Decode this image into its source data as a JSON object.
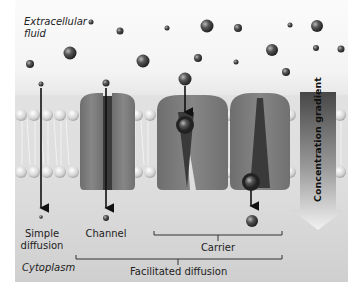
{
  "diagram": {
    "regions": {
      "outside": "Extracellular fluid",
      "inside": "Cytoplasm"
    },
    "labels": {
      "extracellular_line1": "Extracellular",
      "extracellular_line2": "fluid",
      "cytoplasm": "Cytoplasm",
      "simple_line1": "Simple",
      "simple_line2": "diffusion",
      "channel": "Channel",
      "carrier": "Carrier",
      "facilitated": "Facilitated diffusion",
      "gradient": "Concentration gradient"
    },
    "mechanisms": [
      {
        "name": "Simple diffusion",
        "via": "lipid bilayer",
        "molecule_size": "small"
      },
      {
        "name": "Channel",
        "group": "Facilitated diffusion",
        "molecule_size": "small"
      },
      {
        "name": "Carrier",
        "group": "Facilitated diffusion",
        "states": [
          "open to outside",
          "open to inside"
        ],
        "molecule_size": "large"
      }
    ],
    "colors": {
      "membrane_protein": "#7a7a7a",
      "lipid_head": "#d8d8d8",
      "molecule": "#444444",
      "gradient_arrow_top": "#4a4a4a",
      "gradient_arrow_bottom": "#f0f0f0"
    }
  }
}
